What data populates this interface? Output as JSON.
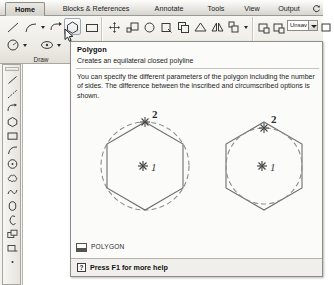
{
  "app": {
    "name": "AutoCAD",
    "accent_color": "#d2d1c9",
    "tooltip_bg": "#fbfbfa",
    "ribbon_bg": "#eceae3"
  },
  "ribbon": {
    "tabs": [
      {
        "label": "Home",
        "active": true
      },
      {
        "label": "Blocks & References",
        "active": false
      },
      {
        "label": "Annotate",
        "active": false
      },
      {
        "label": "Tools",
        "active": false
      },
      {
        "label": "View",
        "active": false
      },
      {
        "label": "Output",
        "active": false
      }
    ],
    "tab_overflow_icon": "refresh-icon",
    "panels": [
      {
        "label": "Draw"
      },
      {
        "label": "Modify"
      },
      {
        "label": "Layers"
      }
    ],
    "draw_buttons": [
      {
        "name": "line-tool",
        "hovered": false
      },
      {
        "name": "arc-tool",
        "hovered": false
      },
      {
        "name": "polyline-tool",
        "hovered": false
      },
      {
        "name": "polygon-tool",
        "hovered": true
      },
      {
        "name": "rectangle-tool",
        "hovered": false
      },
      {
        "name": "circle-tool",
        "hovered": false
      },
      {
        "name": "hatch-tool",
        "hovered": false
      }
    ],
    "modify_buttons": [
      {
        "name": "move-tool"
      },
      {
        "name": "scale-tool"
      },
      {
        "name": "rotate-tool"
      },
      {
        "name": "trim-tool"
      },
      {
        "name": "copy-tool"
      },
      {
        "name": "stretch-tool"
      },
      {
        "name": "mirror-tool"
      },
      {
        "name": "array-tool"
      }
    ],
    "layer_buttons": [
      {
        "name": "layer-properties-tool"
      },
      {
        "name": "layer-state-tool"
      },
      {
        "name": "layer-off-tool"
      }
    ],
    "layer_combo": {
      "name": "layer-state-combo",
      "value": "Unsav"
    }
  },
  "draw_toolbar": {
    "title": "Draw",
    "tools": [
      {
        "name": "line-tool"
      },
      {
        "name": "construction-line-tool"
      },
      {
        "name": "polyline-tool"
      },
      {
        "name": "polygon-tool"
      },
      {
        "name": "rectangle-tool"
      },
      {
        "name": "arc-tool"
      },
      {
        "name": "circle-tool"
      },
      {
        "name": "revision-cloud-tool"
      },
      {
        "name": "spline-tool"
      },
      {
        "name": "ellipse-tool"
      },
      {
        "name": "ellipse-arc-tool"
      },
      {
        "name": "insert-block-tool"
      },
      {
        "name": "make-block-tool"
      },
      {
        "name": "point-tool"
      }
    ]
  },
  "tooltip": {
    "title": "Polygon",
    "summary": "Creates an equilateral closed polyline",
    "description": "You can specify the different parameters of the polygon including the number of sides. The difference between the inscribed and circumscribed options is shown.",
    "figures": [
      {
        "name": "inscribed-polygon-figure",
        "mode": "inscribed",
        "sides": 6,
        "labels": [
          {
            "text": "1",
            "role": "center-point"
          },
          {
            "text": "2",
            "role": "radius-point"
          }
        ]
      },
      {
        "name": "circumscribed-polygon-figure",
        "mode": "circumscribed",
        "sides": 6,
        "labels": [
          {
            "text": "1",
            "role": "center-point"
          },
          {
            "text": "2",
            "role": "radius-point"
          }
        ]
      }
    ],
    "command": {
      "icon": "command-line-icon",
      "label": "POLYGON"
    },
    "footer": {
      "icon": "question-mark-icon",
      "icon_glyph": "?",
      "label": "Press F1 for more help"
    }
  }
}
